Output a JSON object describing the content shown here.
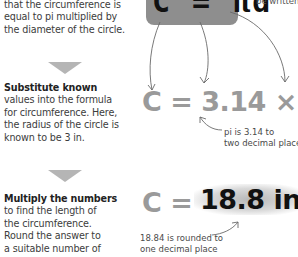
{
  "formula_box": {
    "text": "C = πd"
  },
  "top_note": "be written",
  "steps": [
    {
      "bold": "",
      "text_lines": [
        "that the circumference is",
        "equal to pi multiplied by",
        "the diameter of the circle."
      ]
    },
    {
      "bold": "Substitute known",
      "text_lines": [
        "values into the formula",
        "for circumference. Here,",
        "the radius of the circle is",
        "known to be 3 in."
      ]
    },
    {
      "bold": "Multiply the numbers",
      "text_lines": [
        "to find the length of",
        "the circumference.",
        "Round the answer to",
        "a suitable number of"
      ]
    }
  ],
  "equation_substituted": "C = 3.14 × 6",
  "pi_note": [
    "pi is 3.14 to",
    "two decimal places"
  ],
  "equation_result": {
    "lhs": "C =",
    "answer": "18.8 in"
  },
  "rounding_note": [
    "18.84 is rounded to",
    "one decimal place"
  ],
  "colors": {
    "formula_box": "#8e8e8e",
    "equation_gray": "#9a9a9a",
    "arrow": "#b5b5b5",
    "answer": "#111111"
  }
}
